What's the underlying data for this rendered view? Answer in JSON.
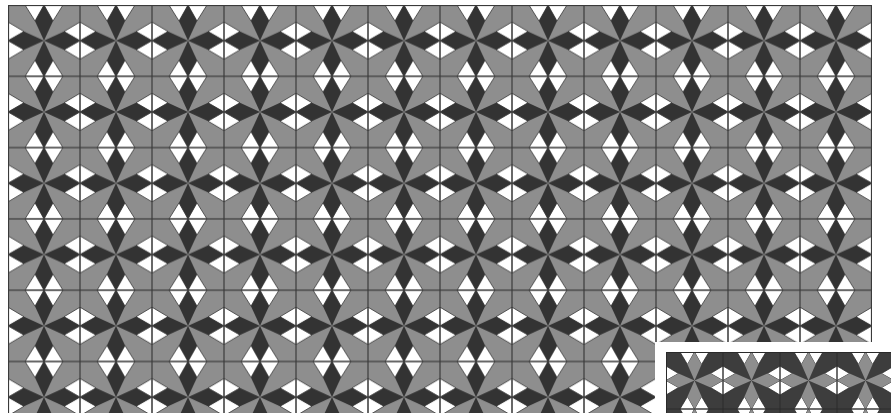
{
  "figure": {
    "main_quilt": {
      "columns": 12,
      "rows_visible": 6,
      "tile_width": 72,
      "tile_height": 71.3,
      "colors": {
        "background": "#8e8e8e",
        "star": "#333333",
        "diamonds": "#ffffff",
        "grid_line": "#3a3a3a"
      }
    },
    "inset_quilt": {
      "columns_visible": 4,
      "tile_width": 57,
      "tile_height": 57,
      "colors": {
        "background": "#3d3d3d",
        "star": "#8e8e8e",
        "diamonds": "#ffffff",
        "grid_line": "#2a2a2a"
      }
    }
  }
}
